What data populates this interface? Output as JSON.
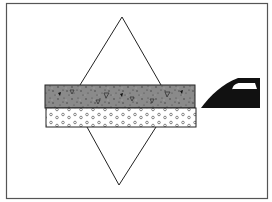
{
  "diagram": {
    "type": "road-layer-load-distribution",
    "colors": {
      "background": "#ffffff",
      "frame": "#555555",
      "line": "#222222",
      "asphalt_fill": "#8a8a8a",
      "asphalt_speckle": "#333333",
      "gravel_fill": "#ffffff",
      "gravel_dot": "#555555",
      "vehicle": "#111111",
      "window": "#ffffff"
    },
    "elements": {
      "frame": {
        "x": 6,
        "y": 3,
        "w": 262,
        "h": 196
      },
      "load_cone_upper": {
        "apex": [
          122,
          17
        ],
        "left": [
          80,
          85
        ],
        "right": [
          161,
          85
        ]
      },
      "load_cone_lower": {
        "apex": [
          119,
          185
        ],
        "left": [
          87,
          127
        ],
        "right": [
          156,
          127
        ]
      },
      "surface_layer": {
        "label": "",
        "x": 45,
        "y": 85,
        "w": 150,
        "h": 23,
        "pattern": "speckled-aggregate"
      },
      "base_layer": {
        "label": "",
        "x": 46,
        "y": 108,
        "w": 150,
        "h": 19,
        "pattern": "gravel-circles"
      },
      "vehicle": {
        "label": "",
        "x": 201,
        "y": 77,
        "w": 60,
        "h": 31
      }
    }
  }
}
